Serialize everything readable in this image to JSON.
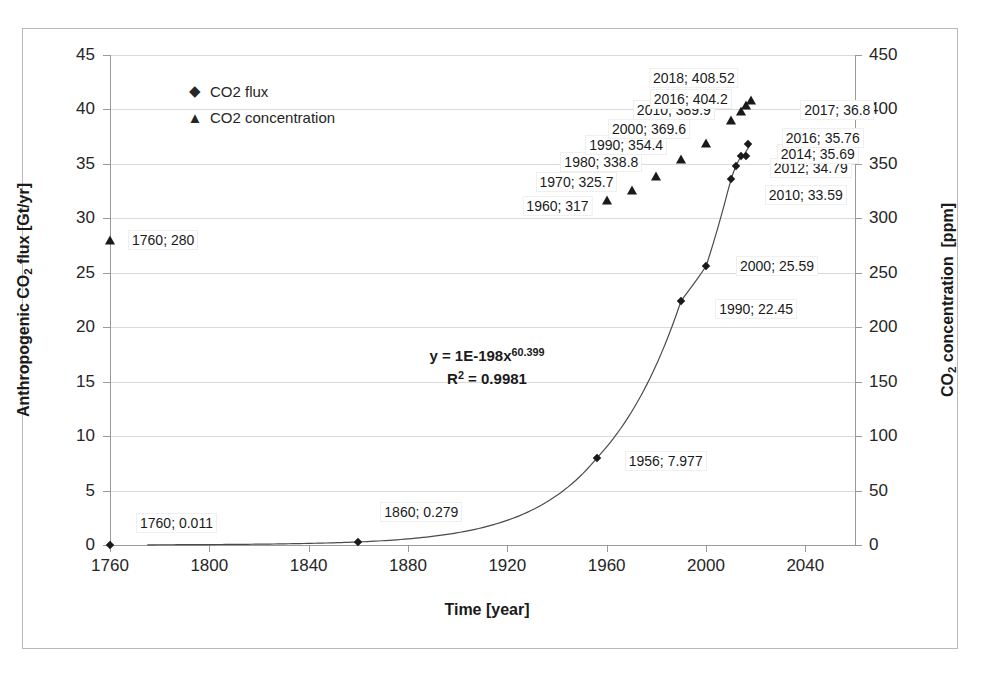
{
  "chart_data": {
    "type": "scatter",
    "title": "",
    "xlabel": "Time [year]",
    "ylabel": "Anthropogenic CO2 flux [Gt/yr]",
    "ylabel_right": "CO2 concentration  [ppm]",
    "xlim": [
      1760,
      2060
    ],
    "ylim": [
      0,
      45
    ],
    "ylim_right": [
      0,
      450
    ],
    "x_ticks": [
      1760,
      1800,
      1840,
      1880,
      1920,
      1960,
      2000,
      2040
    ],
    "y_ticks_left": [
      0,
      5,
      10,
      15,
      20,
      25,
      30,
      35,
      40,
      45
    ],
    "y_ticks_right": [
      0,
      50,
      100,
      150,
      200,
      250,
      300,
      350,
      400,
      450
    ],
    "grid": true,
    "legend_position": "upper-left-inside",
    "legend": [
      {
        "label": "CO2 flux",
        "marker": "diamond"
      },
      {
        "label": "CO2 concentration",
        "marker": "triangle"
      }
    ],
    "annotations": {
      "trendline_equation": "y = 1E-198x",
      "trendline_exponent": "60.399",
      "r_squared_prefix": "R",
      "r_squared_sup": "2",
      "r_squared_value": " = 0.9981"
    },
    "series": [
      {
        "name": "CO2 flux",
        "marker": "diamond",
        "axis": "left",
        "points": [
          {
            "x": 1760,
            "y": 0.011,
            "label": "1760; 0.011",
            "label_dx": 26,
            "label_dy": -22,
            "anchor": "left"
          },
          {
            "x": 1860,
            "y": 0.279,
            "label": "1860; 0.279",
            "label_dx": 22,
            "label_dy": -30,
            "anchor": "left"
          },
          {
            "x": 1956,
            "y": 7.977,
            "label": "1956; 7.977",
            "label_dx": 28,
            "label_dy": 3,
            "anchor": "left"
          },
          {
            "x": 1990,
            "y": 22.45,
            "label": "1990; 22.45",
            "label_dx": 34,
            "label_dy": 8,
            "anchor": "left"
          },
          {
            "x": 2000,
            "y": 25.59,
            "label": "2000; 25.59",
            "label_dx": 30,
            "label_dy": 0,
            "anchor": "left"
          },
          {
            "x": 2010,
            "y": 33.59,
            "label": "2010; 33.59",
            "label_dx": 34,
            "label_dy": 16,
            "anchor": "left"
          },
          {
            "x": 2012,
            "y": 34.79,
            "label": "2012; 34.79",
            "label_dx": 34,
            "label_dy": 2,
            "anchor": "left"
          },
          {
            "x": 2014,
            "y": 35.69,
            "label": "2014; 35.69",
            "label_dx": 36,
            "label_dy": -2,
            "anchor": "left"
          },
          {
            "x": 2016,
            "y": 35.76,
            "label": "2016; 35.76",
            "label_dx": 36,
            "label_dy": -18,
            "anchor": "left"
          },
          {
            "x": 2017,
            "y": 36.8,
            "label": "2017; 36.8",
            "label_dx": 52,
            "label_dy": -34,
            "anchor": "left"
          }
        ]
      },
      {
        "name": "CO2 concentration",
        "marker": "triangle",
        "axis": "right",
        "points": [
          {
            "x": 1760,
            "y": 280,
            "label": "1760; 280",
            "label_dx": 18,
            "label_dy": 0,
            "anchor": "left"
          },
          {
            "x": 1960,
            "y": 317,
            "label": "1960; 317",
            "label_dx": -14,
            "label_dy": 6,
            "anchor": "right"
          },
          {
            "x": 1970,
            "y": 325.7,
            "label": "1970; 325.7",
            "label_dx": -14,
            "label_dy": -8,
            "anchor": "right"
          },
          {
            "x": 1980,
            "y": 338.8,
            "label": "1980; 338.8",
            "label_dx": -14,
            "label_dy": -14,
            "anchor": "right"
          },
          {
            "x": 1990,
            "y": 354.4,
            "label": "1990; 354.4",
            "label_dx": -14,
            "label_dy": -14,
            "anchor": "right"
          },
          {
            "x": 2000,
            "y": 369.6,
            "label": "2000; 369.6",
            "label_dx": -16,
            "label_dy": -14,
            "anchor": "right"
          },
          {
            "x": 2010,
            "y": 389.9,
            "label": "2010; 389.9",
            "label_dx": -16,
            "label_dy": -10,
            "anchor": "right"
          },
          {
            "x": 2014,
            "y": 398.6,
            "label": "",
            "label_dx": 0,
            "label_dy": 0,
            "anchor": "right"
          },
          {
            "x": 2016,
            "y": 404.2,
            "label": "2016; 404.2",
            "label_dx": -14,
            "label_dy": -6,
            "anchor": "right"
          },
          {
            "x": 2018,
            "y": 408.52,
            "label": "2018; 408.52",
            "label_dx": -12,
            "label_dy": -22,
            "anchor": "right"
          }
        ]
      }
    ],
    "trendline": {
      "type": "power",
      "coefficient": "1E-198",
      "exponent": 60.399,
      "x_start": 1775,
      "x_end": 2019
    }
  }
}
